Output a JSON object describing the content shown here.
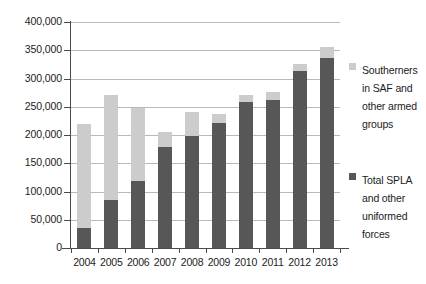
{
  "chart_data": {
    "type": "bar",
    "subtype": "stacked-vertical",
    "title": "",
    "subtitle": "",
    "xlabel": "",
    "ylabel": "",
    "categories": [
      "2004",
      "2005",
      "2006",
      "2007",
      "2008",
      "2009",
      "2010",
      "2011",
      "2012",
      "2013"
    ],
    "series": [
      {
        "name": "Total SPLA and other uniformed forces",
        "color": "#575757",
        "stack_position": "bottom",
        "values": [
          35000,
          85000,
          118000,
          178000,
          198000,
          222000,
          259000,
          262000,
          313000,
          337000
        ]
      },
      {
        "name": "Southerners in SAF and other armed groups",
        "color": "#cccccc",
        "stack_position": "top",
        "values": [
          185000,
          185000,
          129000,
          27000,
          42000,
          16000,
          11000,
          15000,
          12000,
          18000
        ]
      }
    ],
    "totals": [
      220000,
      270000,
      247000,
      205000,
      240000,
      238000,
      270000,
      277000,
      325000,
      355000
    ],
    "ylim": [
      0,
      400000
    ],
    "ytick_step": 50000,
    "ytick_labels": [
      "0",
      "50,000",
      "100,000",
      "150,000",
      "200,000",
      "250,000",
      "300,000",
      "350,000",
      "400,000"
    ],
    "ytick_values": [
      0,
      50000,
      100000,
      150000,
      200000,
      250000,
      300000,
      350000,
      400000
    ],
    "grid": true,
    "grid_axis": "y",
    "legend_position": "right",
    "legend": [
      {
        "label": "Southerners in SAF and other armed groups",
        "color": "#cccccc"
      },
      {
        "label": "Total SPLA and other uniformed forces",
        "color": "#575757"
      }
    ]
  },
  "colors": {
    "series_light": "#cccccc",
    "series_dark": "#575757",
    "gridline": "#b9b9b9",
    "axis": "#4a4a4a",
    "text": "#1c1c1c",
    "background": "#ffffff"
  }
}
